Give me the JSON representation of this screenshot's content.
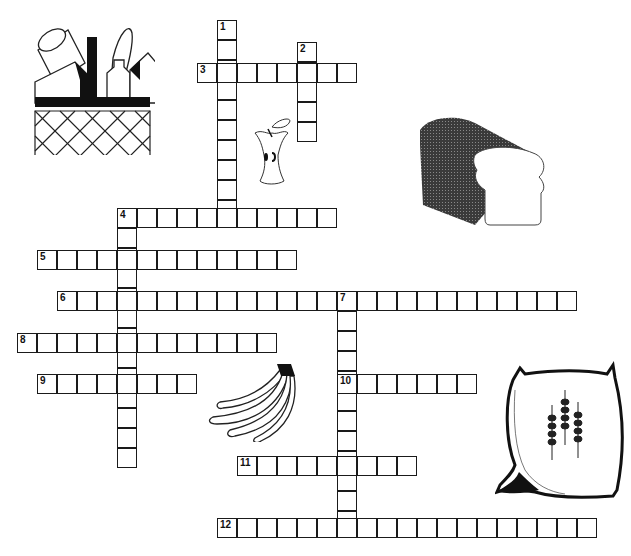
{
  "puzzle": {
    "type": "crossword",
    "cell_size": 20,
    "origin_x": 17,
    "origin_y": 0,
    "entries": [
      {
        "number": "1",
        "direction": "down",
        "x": 217,
        "y": 20,
        "length": 10
      },
      {
        "number": "2",
        "direction": "down",
        "x": 297,
        "y": 42,
        "length": 5
      },
      {
        "number": "3",
        "direction": "across",
        "x": 197,
        "y": 63,
        "length": 8
      },
      {
        "number": "4",
        "direction": "across",
        "x": 117,
        "y": 208,
        "length": 11
      },
      {
        "number": "4",
        "direction": "down",
        "x": 117,
        "y": 208,
        "length": 13
      },
      {
        "number": "5",
        "direction": "across",
        "x": 37,
        "y": 250,
        "length": 13
      },
      {
        "number": "6",
        "direction": "across",
        "x": 57,
        "y": 291,
        "length": 26
      },
      {
        "number": "7",
        "direction": "down",
        "x": 337,
        "y": 291,
        "length": 12
      },
      {
        "number": "8",
        "direction": "across",
        "x": 17,
        "y": 333,
        "length": 13
      },
      {
        "number": "9",
        "direction": "across",
        "x": 37,
        "y": 374,
        "length": 8
      },
      {
        "number": "10",
        "direction": "across",
        "x": 337,
        "y": 374,
        "length": 7
      },
      {
        "number": "11",
        "direction": "across",
        "x": 237,
        "y": 456,
        "length": 9
      },
      {
        "number": "12",
        "direction": "across",
        "x": 217,
        "y": 518,
        "length": 19
      }
    ]
  },
  "illustrations": [
    {
      "name": "grocery-basket",
      "x": 30,
      "y": 25
    },
    {
      "name": "apple-core",
      "x": 250,
      "y": 115
    },
    {
      "name": "bread-loaf",
      "x": 415,
      "y": 115
    },
    {
      "name": "banana-bunch",
      "x": 205,
      "y": 362
    },
    {
      "name": "grain-sack",
      "x": 495,
      "y": 360
    }
  ],
  "colors": {
    "grid_line": "#1a1a1a",
    "background": "#ffffff"
  }
}
